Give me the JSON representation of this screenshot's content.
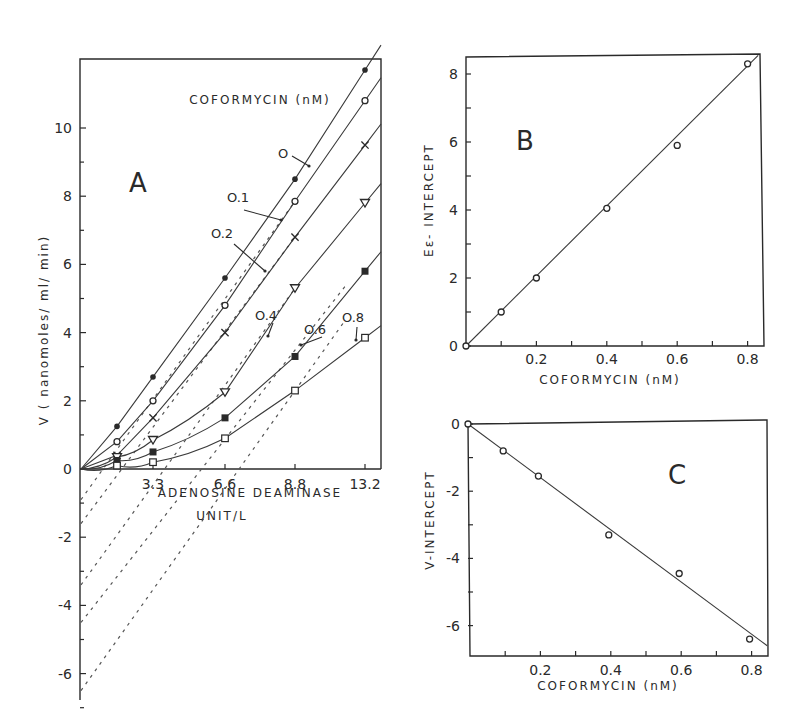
{
  "chart_data": [
    {
      "panel": "A",
      "type": "line",
      "title": "",
      "legend_title": "COFORMYCIN (nM)",
      "xlabel": "ADENOSINE DEAMINASE UNIT/L",
      "ylabel": "V ( nanomoles/ml/ min)",
      "x_ticks": [
        "3.3",
        "6.6",
        "8.8",
        "13.2"
      ],
      "y_ticks": [
        "-6",
        "-4",
        "-2",
        "0",
        "2",
        "4",
        "6",
        "8",
        "10"
      ],
      "ylim": [
        -6.5,
        11.8
      ],
      "grid": false,
      "series": [
        {
          "name": "0",
          "marker": "filled-circle",
          "x": [
            1.1,
            3.3,
            6.6,
            8.8,
            13.2
          ],
          "y": [
            1.25,
            2.7,
            5.6,
            8.5,
            11.7
          ],
          "y_intercept": 0
        },
        {
          "name": "0.1",
          "marker": "open-circle",
          "x": [
            1.1,
            3.3,
            6.6,
            8.8,
            13.2
          ],
          "y": [
            0.8,
            2.0,
            4.8,
            7.85,
            10.8
          ],
          "y_intercept": -0.9
        },
        {
          "name": "0.2",
          "marker": "cross",
          "x": [
            1.1,
            3.3,
            6.6,
            8.8,
            13.2
          ],
          "y": [
            0.4,
            1.5,
            4.0,
            6.8,
            9.5
          ],
          "y_intercept": -1.6
        },
        {
          "name": "0.4",
          "marker": "open-triangle-down",
          "x": [
            1.1,
            3.3,
            6.6,
            8.8,
            13.2
          ],
          "y": [
            0.35,
            0.85,
            2.25,
            5.3,
            7.8
          ],
          "y_intercept": -3.4
        },
        {
          "name": "0.6",
          "marker": "filled-square",
          "x": [
            1.1,
            3.3,
            6.6,
            8.8,
            13.2
          ],
          "y": [
            0.25,
            0.5,
            1.5,
            3.3,
            5.8
          ],
          "y_intercept": -4.5
        },
        {
          "name": "0.8",
          "marker": "open-square",
          "x": [
            1.1,
            3.3,
            6.6,
            8.8,
            13.2
          ],
          "y": [
            0.1,
            0.2,
            0.9,
            2.3,
            3.85
          ],
          "y_intercept": -6.5
        }
      ]
    },
    {
      "panel": "B",
      "type": "scatter",
      "xlabel": "COFORMYCIN (nM)",
      "ylabel": "Eε-INTERCEPT",
      "x_ticks": [
        "0.2",
        "0.4",
        "0.6",
        "0.8"
      ],
      "y_ticks": [
        "0",
        "2",
        "4",
        "6",
        "8"
      ],
      "xlim": [
        0,
        0.85
      ],
      "ylim": [
        0,
        8.5
      ],
      "grid": false,
      "series": [
        {
          "name": "E-intercept",
          "marker": "open-circle",
          "x": [
            0,
            0.1,
            0.2,
            0.4,
            0.6,
            0.8
          ],
          "y": [
            0,
            1.0,
            2.0,
            4.05,
            5.9,
            8.3
          ]
        }
      ],
      "fit_line": {
        "x": [
          0,
          0.83
        ],
        "y": [
          0,
          8.55
        ]
      }
    },
    {
      "panel": "C",
      "type": "scatter",
      "xlabel": "COFORMYCIN (nM)",
      "ylabel": "V-INTERCEPT",
      "x_ticks": [
        "0.2",
        "0.4",
        "0.6",
        "0.8"
      ],
      "y_ticks": [
        "0",
        "-2",
        "-4",
        "-6"
      ],
      "xlim": [
        0,
        0.85
      ],
      "ylim": [
        -7,
        0
      ],
      "grid": false,
      "series": [
        {
          "name": "V-intercept",
          "marker": "open-circle",
          "x": [
            0,
            0.1,
            0.2,
            0.4,
            0.6,
            0.8
          ],
          "y": [
            0,
            -0.8,
            -1.55,
            -3.3,
            -4.45,
            -6.4
          ]
        }
      ],
      "fit_line": {
        "x": [
          0,
          0.85
        ],
        "y": [
          0,
          -6.6
        ]
      }
    }
  ],
  "labels": {
    "panel_a": "A",
    "panel_b": "B",
    "panel_c": "C",
    "a_legend_title": "COFORMYCIN (nM)",
    "a_xlabel_line1": "ADENOSINE DEAMINASE",
    "a_xlabel_line2": "UNIT/L",
    "a_ylabel": "V  ( nanomoles/ ml/ min)",
    "b_xlabel": "COFORMYCIN (nM)",
    "b_ylabel": "Eε- INTERCEPT",
    "c_xlabel": "COFORMYCIN (nM)",
    "c_ylabel": "V-INTERCEPT"
  }
}
